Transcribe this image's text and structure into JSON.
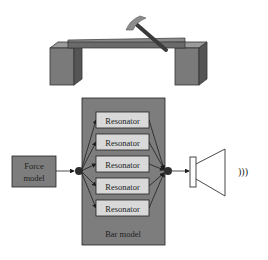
{
  "illustration": {
    "description": "Hammer striking a bar resting on two supports",
    "colors": {
      "support": "#7a7a7a",
      "support_dark": "#5a5a5a",
      "bar": "#6d6d6d",
      "hammer": "#3a3a3a"
    }
  },
  "diagram": {
    "force_model": {
      "label_line1": "Force",
      "label_line2": "model"
    },
    "bar_model": {
      "label": "Bar model",
      "resonators": [
        {
          "label": "Resonator"
        },
        {
          "label": "Resonator"
        },
        {
          "label": "Resonator"
        },
        {
          "label": "Resonator"
        },
        {
          "label": "Resonator"
        }
      ]
    },
    "output": {
      "speaker_icon": "speaker-icon",
      "sound_waves": ")))"
    },
    "colors": {
      "bar_model_fill": "#7d7d7d",
      "force_model_fill": "#7d7d7d",
      "resonator_fill": "#d9d9d9",
      "node_fill": "#2e2e2e",
      "line": "#1e1e1e"
    }
  }
}
